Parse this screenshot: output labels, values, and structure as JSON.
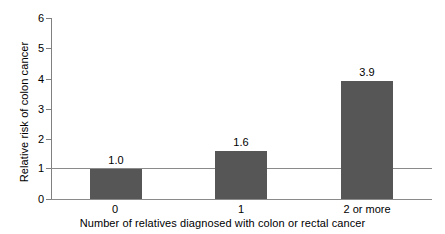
{
  "chart_data": {
    "type": "bar",
    "title": "",
    "subtitle": "",
    "xlabel": "Number of relatives diagnosed with colon or rectal cancer",
    "ylabel": "Relative risk of colon cancer",
    "categories": [
      "0",
      "1",
      "2 or more"
    ],
    "values": [
      1.0,
      1.6,
      3.9
    ],
    "value_labels": [
      "1.0",
      "1.6",
      "3.9"
    ],
    "series": [
      {
        "name": "Relative risk of colon cancer",
        "values": [
          1.0,
          1.6,
          3.9
        ]
      }
    ],
    "ylim": [
      0,
      6
    ],
    "xlim_categories": 3,
    "ytick_labels": [
      "0",
      "1",
      "2",
      "3",
      "4",
      "5",
      "6"
    ],
    "ytick_values": [
      0,
      1,
      2,
      3,
      4,
      5,
      6
    ],
    "grid": false,
    "legend": "none",
    "reference_line": {
      "value": 1,
      "label": ""
    },
    "bar_color": "#565656",
    "axis_color": "#8a8a8a",
    "text_color": "#000000",
    "background_color": "#ffffff"
  }
}
